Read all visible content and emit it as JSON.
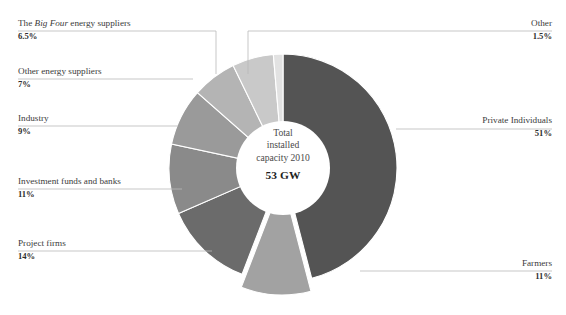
{
  "chart_data": {
    "type": "pie",
    "title": "",
    "subtitle": "",
    "xlabel": "",
    "ylabel": "",
    "legend_position": "none",
    "grid": false,
    "donut": true,
    "start_angle_deg": 0,
    "direction": "clockwise",
    "center_label": {
      "line1": "Total",
      "line2": "installed",
      "line3": "capacity 2010",
      "total": "53 GW"
    },
    "categories": [
      "Private Individuals",
      "Farmers",
      "Project firms",
      "Investment funds and banks",
      "Industry",
      "Other energy suppliers",
      "The Big Four energy suppliers",
      "Other"
    ],
    "values": [
      51,
      11,
      14,
      11,
      9,
      7,
      6.5,
      1.5
    ],
    "value_labels": [
      "51%",
      "11%",
      "14%",
      "11%",
      "9%",
      "7%",
      "6.5%",
      "1.5%"
    ],
    "colors": [
      "#545454",
      "#a2a2a2",
      "#6b6b6b",
      "#8a8a8a",
      "#9a9a9a",
      "#b4b4b4",
      "#c9c9c9",
      "#e2e2e2"
    ],
    "exploded": [
      "Farmers"
    ],
    "slices": [
      {
        "name": "Private Individuals",
        "value": 51,
        "value_label": "51%",
        "color": "#545454",
        "exploded": false,
        "label_side": "right",
        "label_html": "Private Individuals"
      },
      {
        "name": "Farmers",
        "value": 11,
        "value_label": "11%",
        "color": "#a2a2a2",
        "exploded": true,
        "label_side": "right",
        "label_html": "Farmers"
      },
      {
        "name": "Project firms",
        "value": 14,
        "value_label": "14%",
        "color": "#6b6b6b",
        "exploded": false,
        "label_side": "left",
        "label_html": "Project firms"
      },
      {
        "name": "Investment funds and banks",
        "value": 11,
        "value_label": "11%",
        "color": "#8a8a8a",
        "exploded": false,
        "label_side": "left",
        "label_html": "Investment funds and banks"
      },
      {
        "name": "Industry",
        "value": 9,
        "value_label": "9%",
        "color": "#9a9a9a",
        "exploded": false,
        "label_side": "left",
        "label_html": "Industry"
      },
      {
        "name": "Other energy suppliers",
        "value": 7,
        "value_label": "7%",
        "color": "#b4b4b4",
        "exploded": false,
        "label_side": "left",
        "label_html": "Other energy suppliers"
      },
      {
        "name": "The Big Four energy suppliers",
        "value": 6.5,
        "value_label": "6.5%",
        "color": "#c9c9c9",
        "exploded": false,
        "label_side": "left",
        "label_html": "The <em>Big Four</em> energy suppliers"
      },
      {
        "name": "Other",
        "value": 1.5,
        "value_label": "1.5%",
        "color": "#e2e2e2",
        "exploded": false,
        "label_side": "right",
        "label_html": "Other"
      }
    ]
  },
  "labels": {
    "big_four": {
      "name_html": "The <em>Big Four</em> energy suppliers",
      "value": "6.5%"
    },
    "other_energy": {
      "name_html": "Other energy suppliers",
      "value": "7%"
    },
    "industry": {
      "name_html": "Industry",
      "value": "9%"
    },
    "investment": {
      "name_html": "Investment funds and banks",
      "value": "11%"
    },
    "project_firms": {
      "name_html": "Project firms",
      "value": "14%"
    },
    "other": {
      "name_html": "Other",
      "value": "1.5%"
    },
    "private_individuals": {
      "name_html": "Private Individuals",
      "value": "51%"
    },
    "farmers": {
      "name_html": "Farmers",
      "value": "11%"
    }
  },
  "center": {
    "line1": "Total",
    "line2": "installed",
    "line3": "capacity 2010",
    "total": "53 GW"
  },
  "style": {
    "background": "#ffffff",
    "leader_line_color": "#b9b9b9",
    "text_color": "#3b3b3b"
  }
}
